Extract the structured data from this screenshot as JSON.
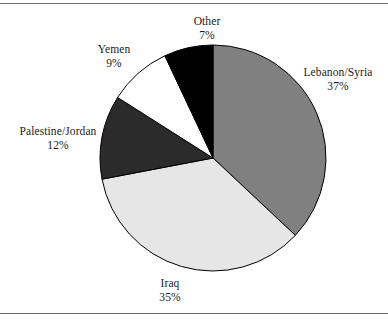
{
  "chart_data": {
    "type": "pie",
    "title": "",
    "subtitle": "",
    "legend_position": "none",
    "grid": false,
    "start_angle_deg": 0,
    "direction": "clockwise",
    "categories": [
      "Lebanon/Syria",
      "Iraq",
      "Palestine/Jordan",
      "Yemen",
      "Other"
    ],
    "values": [
      37,
      35,
      12,
      9,
      7
    ],
    "units": "percent",
    "slices": [
      {
        "label": "Lebanon/Syria",
        "value": 37,
        "pct_text": "37%",
        "color": "#808080",
        "stroke": "#000000"
      },
      {
        "label": "Iraq",
        "value": 35,
        "pct_text": "35%",
        "color": "#e6e6e6",
        "stroke": "#000000"
      },
      {
        "label": "Palestine/Jordan",
        "value": 12,
        "pct_text": "12%",
        "color": "#2b2b2b",
        "stroke": "#000000"
      },
      {
        "label": "Yemen",
        "value": 9,
        "pct_text": "9%",
        "color": "#ffffff",
        "stroke": "#000000"
      },
      {
        "label": "Other",
        "value": 7,
        "pct_text": "7%",
        "color": "#000000",
        "stroke": "#000000"
      }
    ]
  },
  "labels": {
    "other": {
      "name": "Other",
      "pct": "7%"
    },
    "yemen": {
      "name": "Yemen",
      "pct": "9%"
    },
    "palestine_jordan": {
      "name": "Palestine/Jordan",
      "pct": "12%"
    },
    "lebanon_syria": {
      "name": "Lebanon/Syria",
      "pct": "37%"
    },
    "iraq": {
      "name": "Iraq",
      "pct": "35%"
    }
  },
  "figure": {
    "background": "#ffffff",
    "rule_color": "#6b6b6b",
    "text_color": "#1a1a1a",
    "center_x": 213,
    "center_y": 154,
    "radius": 113
  }
}
